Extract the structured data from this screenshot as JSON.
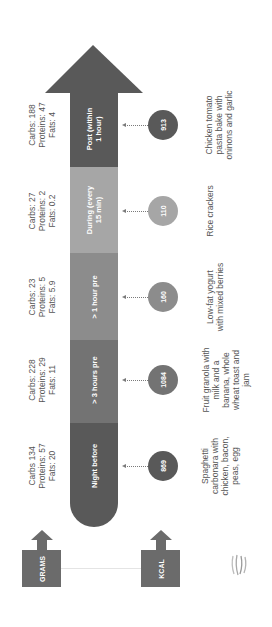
{
  "colors": {
    "arrow_head": "#595959",
    "post": "#595959",
    "during": "#a6a6a6",
    "one_hour_pre": "#8c8c8c",
    "three_hours_pre": "#737373",
    "night_before": "#595959",
    "legend": "#6b6b6b",
    "text": "#555555"
  },
  "stages": [
    {
      "label": "Post (within 1 hour)",
      "macros": [
        "Carbs: 188",
        "Proteins: 47",
        "Fats: 4"
      ],
      "kcal": "913",
      "food": [
        "Chicken tomato",
        "pasta bake with",
        "oninons and garlic"
      ]
    },
    {
      "label": "During (every 15 min)",
      "macros": [
        "Carbs: 27",
        "Proteins: 2",
        "Fats: 0.2"
      ],
      "kcal": "110",
      "food": [
        "Rice crackers"
      ]
    },
    {
      "label": "> 1 hour pre",
      "macros": [
        "Carbs: 23",
        "Proteins: 5",
        "Fats: 5.9"
      ],
      "kcal": "160",
      "food": [
        "Low-fat yogurt",
        "with mixed berries"
      ]
    },
    {
      "label": "> 3 hours pre",
      "macros": [
        "Carbs: 228",
        "Proteins: 29",
        "Fats: 11"
      ],
      "kcal": "1084",
      "food": [
        "Fruit granola with",
        "milk and a",
        "banana, whole",
        "wheat toast and",
        "jam"
      ]
    },
    {
      "label": "Night before",
      "macros": [
        "Carbs 134",
        "Proteins: 57",
        "Fats: 20"
      ],
      "kcal": "869",
      "food": [
        "Spaghetti",
        "carbonara with",
        "chicken, bacon,",
        "peas, egg"
      ]
    }
  ],
  "stage_labels": {
    "post_line1": "Post (within",
    "post_line2": "1 hour)",
    "during_line1": "During (every",
    "during_line2": "15 min)"
  },
  "legend": {
    "grams": "GRAMS",
    "kcal": "KCAL"
  },
  "logo": {
    "icon": "stripes-logo-icon"
  }
}
